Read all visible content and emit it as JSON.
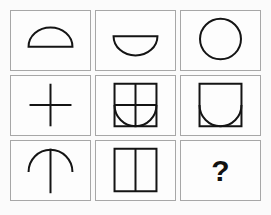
{
  "puzzle": {
    "type": "matrix-reasoning",
    "rows": 3,
    "columns": 3,
    "missing_cell": "row3-col3",
    "answer_placeholder": "?",
    "colors": {
      "background": "#fbfbfb",
      "cell_background": "#fdfdfd",
      "cell_border": "#a7a7a7",
      "shape_stroke": "#141414",
      "question_mark": "#111111"
    },
    "cells": [
      {
        "id": "cell-1",
        "position": "row1-col1",
        "shape_name": "semicircle-dome",
        "description": "Semicircle with flat side down (dome / arch filled outline)"
      },
      {
        "id": "cell-2",
        "position": "row1-col2",
        "shape_name": "semicircle-bowl",
        "description": "Semicircle with flat side up (bowl)"
      },
      {
        "id": "cell-3",
        "position": "row1-col3",
        "shape_name": "circle",
        "description": "Full circle (dome combined with bowl)"
      },
      {
        "id": "cell-4",
        "position": "row2-col1",
        "shape_name": "plus-cross",
        "description": "Plus sign / cross made of a vertical and a horizontal line"
      },
      {
        "id": "cell-5",
        "position": "row2-col2",
        "shape_name": "square-with-cross-and-bowl",
        "description": "Square divided into four quadrants by a cross, with a bowl semicircle along the bottom edge"
      },
      {
        "id": "cell-6",
        "position": "row2-col3",
        "shape_name": "square-with-bowl",
        "description": "Square containing a bowl semicircle along the bottom edge"
      },
      {
        "id": "cell-7",
        "position": "row3-col1",
        "shape_name": "vertical-line-with-dome",
        "description": "Vertical line with a dome arch crossing over its upper portion"
      },
      {
        "id": "cell-8",
        "position": "row3-col2",
        "shape_name": "square-with-vertical-divider",
        "description": "Square divided by a single vertical centre line"
      },
      {
        "id": "cell-9",
        "position": "row3-col3",
        "shape_name": "question-mark",
        "description": "Bold question mark marking the missing tile",
        "label": "?"
      }
    ]
  }
}
